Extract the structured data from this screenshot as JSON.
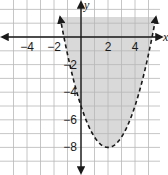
{
  "chart_data": {
    "type": "inequality-graph",
    "title": "",
    "xlabel": "x",
    "ylabel": "y",
    "xlim": [
      -6,
      6
    ],
    "ylim": [
      -10,
      2
    ],
    "grid": true,
    "x_tick_labels": [
      "-4",
      "-2",
      "2",
      "4"
    ],
    "x_tick_values": [
      -4,
      -2,
      2,
      4
    ],
    "y_tick_labels": [
      "-2",
      "-4",
      "-6",
      "-8"
    ],
    "y_tick_values": [
      -2,
      -4,
      -6,
      -8
    ],
    "boundary": {
      "kind": "parabola",
      "equation": "y = 0.75(x - 2)^2 - 8",
      "a": 0.75,
      "h": 2,
      "k": -8,
      "vertex": [
        2,
        -8
      ],
      "y_intercept": -5,
      "style": "dashed"
    },
    "shaded_region": "y > 0.75(x - 2)^2 - 8 (inside/above parabola)",
    "shade_color": "#d9d9d9"
  }
}
